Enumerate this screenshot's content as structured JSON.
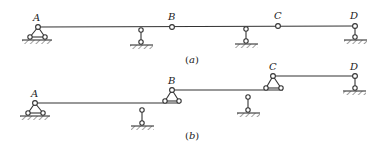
{
  "diagram": {
    "type": "multi-span beam structural schematic",
    "figures": [
      {
        "caption": "(a)",
        "caption_letter": "a",
        "nodes": [
          {
            "id": "A",
            "label": "A",
            "support": "fixed-pin (triangle)"
          },
          {
            "id": "B",
            "label": "B",
            "support": "internal hinge"
          },
          {
            "id": "C",
            "label": "C",
            "support": "internal hinge"
          },
          {
            "id": "D",
            "label": "D",
            "support": "link (roller)"
          }
        ],
        "intermediate_supports": 2,
        "description": "Continuous beam A–D with hinges at B and C, link supports between A–B and B–C"
      },
      {
        "caption": "(b)",
        "caption_letter": "b",
        "nodes": [
          {
            "id": "A",
            "label": "A",
            "support": "fixed-pin (triangle)"
          },
          {
            "id": "B",
            "label": "B",
            "support": "pin seated on lower beam"
          },
          {
            "id": "C",
            "label": "C",
            "support": "pin seated on lower beam"
          },
          {
            "id": "D",
            "label": "D",
            "support": "link (roller)"
          }
        ],
        "intermediate_supports": 2,
        "description": "Layered (hierarchy) diagram of the same structure: AB base part, B–C and C–D as supported sub-parts"
      }
    ],
    "colors": {
      "line": "#333333",
      "background": "#ffffff"
    }
  }
}
